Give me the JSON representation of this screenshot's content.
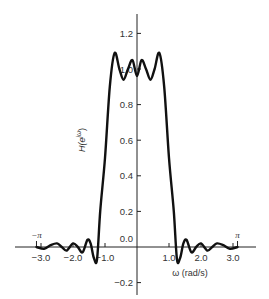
{
  "chart_data": {
    "type": "line",
    "title": "",
    "xlabel": "ω (rad/s)",
    "ylabel": "H(e^{jω})",
    "xlim": [
      -3.6,
      3.6
    ],
    "ylim": [
      -0.25,
      1.3
    ],
    "grid": false,
    "legend": null,
    "x_ticks": [
      {
        "value": -3.0,
        "label": "−3.0"
      },
      {
        "value": -2.0,
        "label": "−2.0"
      },
      {
        "value": -1.0,
        "label": "−1.0"
      },
      {
        "value": 1.0,
        "label": "1.0"
      },
      {
        "value": 2.0,
        "label": "2.0"
      },
      {
        "value": 3.0,
        "label": "3.0"
      }
    ],
    "pi_markers": [
      {
        "value": -3.14159,
        "label": "−π"
      },
      {
        "value": 3.14159,
        "label": "π"
      }
    ],
    "y_ticks": [
      {
        "value": 1.2,
        "label": "1.2"
      },
      {
        "value": 1.0,
        "label": "1.0"
      },
      {
        "value": 0.8,
        "label": "0.8"
      },
      {
        "value": 0.6,
        "label": "0.6"
      },
      {
        "value": 0.4,
        "label": "0.4"
      },
      {
        "value": 0.2,
        "label": "0.2"
      },
      {
        "value": 0.0,
        "label": "0.0"
      },
      {
        "value": -0.2,
        "label": "−0.2"
      }
    ],
    "series": [
      {
        "name": "H(e^{jω})",
        "x": [
          -3.14,
          -2.9,
          -2.7,
          -2.5,
          -2.35,
          -2.2,
          -2.0,
          -1.85,
          -1.7,
          -1.55,
          -1.45,
          -1.35,
          -1.25,
          -1.15,
          -1.0,
          -0.85,
          -0.7,
          -0.55,
          -0.42,
          -0.28,
          -0.14,
          0.0,
          0.14,
          0.28,
          0.42,
          0.55,
          0.7,
          0.85,
          1.0,
          1.15,
          1.25,
          1.35,
          1.45,
          1.55,
          1.7,
          1.85,
          2.0,
          2.2,
          2.35,
          2.5,
          2.7,
          2.9,
          3.14
        ],
        "y": [
          0.0,
          -0.01,
          0.01,
          0.02,
          0.0,
          -0.02,
          0.02,
          0.0,
          -0.03,
          0.04,
          0.02,
          -0.06,
          -0.07,
          0.2,
          0.5,
          0.9,
          1.09,
          1.0,
          0.94,
          1.0,
          1.05,
          0.96,
          1.05,
          1.0,
          0.94,
          1.0,
          1.09,
          0.9,
          0.5,
          0.2,
          -0.07,
          -0.06,
          0.02,
          0.04,
          -0.03,
          0.0,
          0.02,
          -0.02,
          0.0,
          0.02,
          0.01,
          -0.01,
          0.0
        ]
      }
    ]
  }
}
